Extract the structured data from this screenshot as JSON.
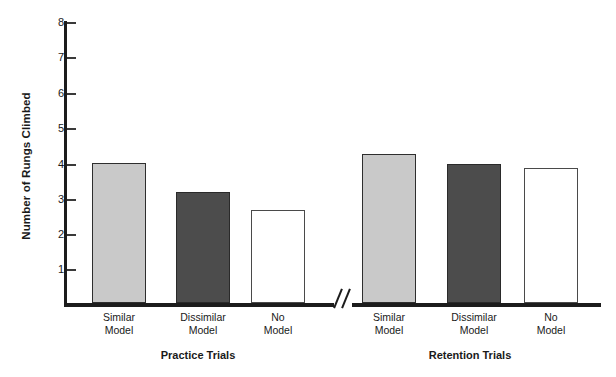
{
  "chart_data": {
    "type": "bar",
    "title": "",
    "xlabel": "",
    "ylabel": "Number of Rungs Climbed",
    "ylim": [
      0,
      8
    ],
    "ytick_labels": [
      "8",
      "7",
      "6",
      "5",
      "4",
      "3",
      "2",
      "1"
    ],
    "ytick_values": [
      8,
      7,
      6,
      5,
      4,
      3,
      2,
      1
    ],
    "grid": false,
    "legend": "none",
    "axis_break": true,
    "axis_break_label": "//",
    "categories": [
      "Similar Model",
      "Dissimilar Model",
      "No Model"
    ],
    "groups": [
      {
        "name": "Practice Trials",
        "bars": [
          {
            "label_line1": "Similar",
            "label_line2": "Model",
            "value": 4.0,
            "fill": "light",
            "color": "#c9c9c9"
          },
          {
            "label_line1": "Dissimilar",
            "label_line2": "Model",
            "value": 3.15,
            "fill": "dark",
            "color": "#4c4c4c"
          },
          {
            "label_line1": "No",
            "label_line2": "Model",
            "value": 2.65,
            "fill": "white",
            "color": "#ffffff"
          }
        ]
      },
      {
        "name": "Retention Trials",
        "bars": [
          {
            "label_line1": "Similar",
            "label_line2": "Model",
            "value": 4.25,
            "fill": "light",
            "color": "#c9c9c9"
          },
          {
            "label_line1": "Dissimilar",
            "label_line2": "Model",
            "value": 3.95,
            "fill": "dark",
            "color": "#4c4c4c"
          },
          {
            "label_line1": "No",
            "label_line2": "Model",
            "value": 3.85,
            "fill": "white",
            "color": "#ffffff"
          }
        ]
      }
    ],
    "series": [
      {
        "name": "Practice Trials",
        "values": [
          4.0,
          3.15,
          2.65
        ]
      },
      {
        "name": "Retention Trials",
        "values": [
          4.25,
          3.95,
          3.85
        ]
      }
    ]
  }
}
